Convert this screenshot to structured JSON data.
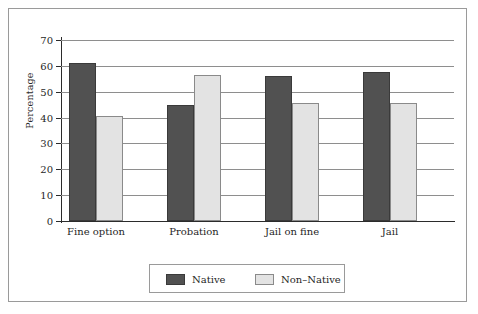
{
  "chart_data": {
    "type": "bar",
    "title": "",
    "xlabel": "",
    "ylabel": "Percentage",
    "categories": [
      "Fine option",
      "Probation",
      "Jail on fine",
      "Jail"
    ],
    "series": [
      {
        "name": "Native",
        "color": "#515151",
        "values": [
          61,
          45,
          56,
          57.5
        ]
      },
      {
        "name": "Non–Native",
        "color": "#e3e3e3",
        "values": [
          40.5,
          56.5,
          45.5,
          45.5
        ]
      }
    ],
    "ylim": [
      0,
      70
    ],
    "yticks": [
      0,
      10,
      20,
      30,
      40,
      50,
      60,
      70
    ],
    "ytick_labels": [
      "0",
      "10",
      "20",
      "30",
      "40",
      "50",
      "60",
      "70"
    ],
    "grid": true,
    "legend_position": "bottom"
  },
  "legend": {
    "items": [
      {
        "label": "Native",
        "swatch": "native"
      },
      {
        "label": "Non–Native",
        "swatch": "nonnative"
      }
    ]
  },
  "colors": {
    "native": "#515151",
    "non_native": "#e3e3e3",
    "gridline": "#8e8e8e",
    "axis": "#2b2b2b",
    "frame": "#9a9a9a",
    "background": "#ffffff"
  }
}
